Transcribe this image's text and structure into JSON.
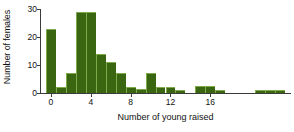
{
  "chart_data": {
    "type": "bar",
    "title": "",
    "xlabel": "Number of young raised",
    "ylabel": "Number of females",
    "xlim": [
      -1,
      24
    ],
    "ylim": [
      0,
      30
    ],
    "grid": false,
    "legend": null,
    "bar_color": "#3A6612",
    "bar_edge_color": "#7FA94B",
    "axis_color": "#3B3B3B",
    "x_ticks": [
      0,
      4,
      8,
      12,
      16
    ],
    "x_tick_labels": [
      "0",
      "4",
      "8",
      "12",
      "16"
    ],
    "y_ticks": [
      0,
      10,
      20,
      30
    ],
    "y_tick_labels": [
      "0",
      "10",
      "20",
      "30"
    ],
    "categories": [
      0,
      1,
      2,
      3,
      4,
      5,
      6,
      7,
      8,
      9,
      10,
      11,
      12,
      13,
      15,
      16,
      17,
      21,
      22,
      23
    ],
    "values": [
      23,
      2,
      7,
      29,
      29,
      14,
      11,
      7,
      2,
      1.5,
      7,
      2,
      2,
      1,
      2.5,
      2.5,
      1,
      1,
      1,
      1
    ]
  }
}
